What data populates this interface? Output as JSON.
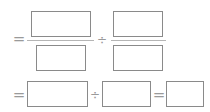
{
  "row1": {
    "equals": "=",
    "divide": "÷",
    "left_fraction": {
      "numerator": "",
      "denominator": ""
    },
    "right_fraction": {
      "numerator": "",
      "denominator": ""
    }
  },
  "row2": {
    "equals1": "=",
    "divide": "÷",
    "equals2": "=",
    "box1": "",
    "box2": "",
    "result": ""
  }
}
